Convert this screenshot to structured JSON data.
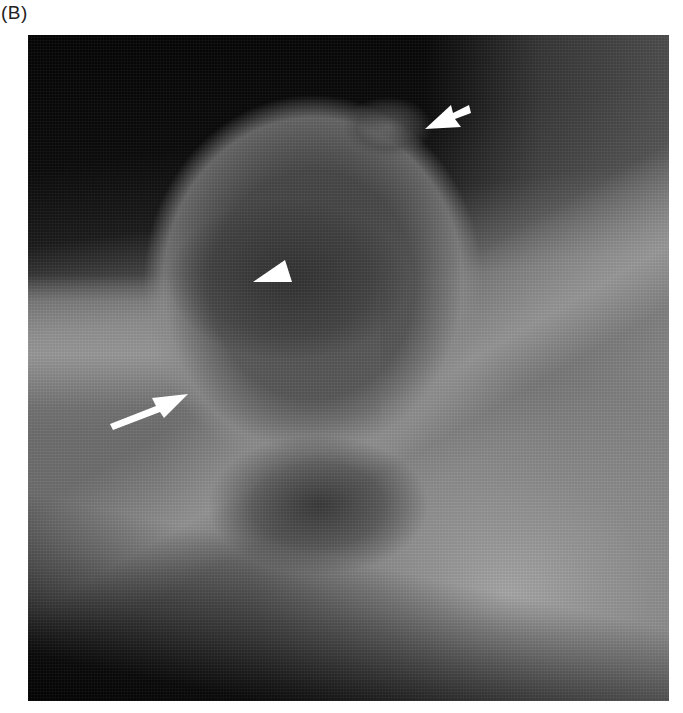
{
  "figure": {
    "panel_label": "(B)",
    "image_type": "radiograph",
    "annotations": [
      {
        "type": "short-arrow",
        "position": "upper-right",
        "color": "#ffffff"
      },
      {
        "type": "arrowhead",
        "position": "center",
        "color": "#ffffff"
      },
      {
        "type": "long-arrow",
        "position": "lower-left",
        "color": "#ffffff"
      }
    ]
  }
}
